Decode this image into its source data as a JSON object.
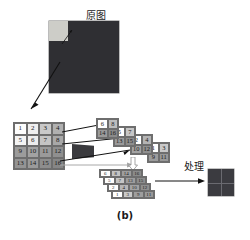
{
  "figure": {
    "caption": "(b)",
    "original_label": "原图",
    "process_label": "处理"
  },
  "source_grid": {
    "rows": 4,
    "cols": 4,
    "cells": [
      {
        "v": "1",
        "shade": "#fdfdfd"
      },
      {
        "v": "2",
        "shade": "#efefef"
      },
      {
        "v": "3",
        "shade": "#c9c9c9"
      },
      {
        "v": "4",
        "shade": "#b0b0b0"
      },
      {
        "v": "5",
        "shade": "#f4f4f4"
      },
      {
        "v": "6",
        "shade": "#ededed"
      },
      {
        "v": "7",
        "shade": "#c4c4c4"
      },
      {
        "v": "8",
        "shade": "#a8a8a8"
      },
      {
        "v": "9",
        "shade": "#9c9c9c"
      },
      {
        "v": "10",
        "shade": "#a2a2a2"
      },
      {
        "v": "11",
        "shade": "#9a9a9a"
      },
      {
        "v": "12",
        "shade": "#8f8f8f"
      },
      {
        "v": "13",
        "shade": "#949494"
      },
      {
        "v": "14",
        "shade": "#9a9a9a"
      },
      {
        "v": "15",
        "shade": "#8d8d8d"
      },
      {
        "v": "16",
        "shade": "#868686"
      }
    ]
  },
  "sub_cards": [
    {
      "name": "card-a",
      "cells": [
        {
          "v": "6",
          "shade": "#ffffff"
        },
        {
          "v": "8",
          "shade": "#bdbdbd"
        },
        {
          "v": "14",
          "shade": "#9a9a9a"
        },
        {
          "v": "16",
          "shade": "#8a8a8a"
        }
      ]
    },
    {
      "name": "card-b",
      "cells": [
        {
          "v": "5",
          "shade": "#ffffff"
        },
        {
          "v": "7",
          "shade": "#c6c6c6"
        },
        {
          "v": "13",
          "shade": "#9a9a9a"
        },
        {
          "v": "15",
          "shade": "#8d8d8d"
        }
      ]
    },
    {
      "name": "card-c",
      "cells": [
        {
          "v": "2",
          "shade": "#ffffff"
        },
        {
          "v": "4",
          "shade": "#b4b4b4"
        },
        {
          "v": "10",
          "shade": "#a2a2a2"
        },
        {
          "v": "12",
          "shade": "#8f8f8f"
        }
      ]
    },
    {
      "name": "card-d",
      "cells": [
        {
          "v": "1",
          "shade": "#ffffff"
        },
        {
          "v": "3",
          "shade": "#c9c9c9"
        },
        {
          "v": "9",
          "shade": "#9c9c9c"
        },
        {
          "v": "11",
          "shade": "#989898"
        }
      ]
    }
  ],
  "flat_strips": [
    {
      "name": "strip-a",
      "cells": [
        {
          "v": "6",
          "shade": "#ffffff"
        },
        {
          "v": "8",
          "shade": "#c4c4c4"
        },
        {
          "v": "14",
          "shade": "#9d9d9d"
        },
        {
          "v": "16",
          "shade": "#8a8a8a"
        }
      ]
    },
    {
      "name": "strip-b",
      "cells": [
        {
          "v": "5",
          "shade": "#ffffff"
        },
        {
          "v": "7",
          "shade": "#c6c6c6"
        },
        {
          "v": "13",
          "shade": "#9d9d9d"
        },
        {
          "v": "15",
          "shade": "#8d8d8d"
        }
      ]
    },
    {
      "name": "strip-c",
      "cells": [
        {
          "v": "2",
          "shade": "#ffffff"
        },
        {
          "v": "4",
          "shade": "#b6b6b6"
        },
        {
          "v": "10",
          "shade": "#a2a2a2"
        },
        {
          "v": "12",
          "shade": "#8f8f8f"
        }
      ]
    },
    {
      "name": "strip-d",
      "cells": [
        {
          "v": "1",
          "shade": "#ffffff"
        },
        {
          "v": "3",
          "shade": "#c9c9c9"
        },
        {
          "v": "9",
          "shade": "#9e9e9e"
        },
        {
          "v": "11",
          "shade": "#989898"
        }
      ]
    }
  ],
  "colors": {
    "dark_block": "#2f2f33",
    "patch": "#cdcdc8",
    "result_block": "#3b3b40",
    "arrow": "#111111",
    "gray_arrow": "#9a9a9a",
    "border": "#6e6e6e"
  }
}
